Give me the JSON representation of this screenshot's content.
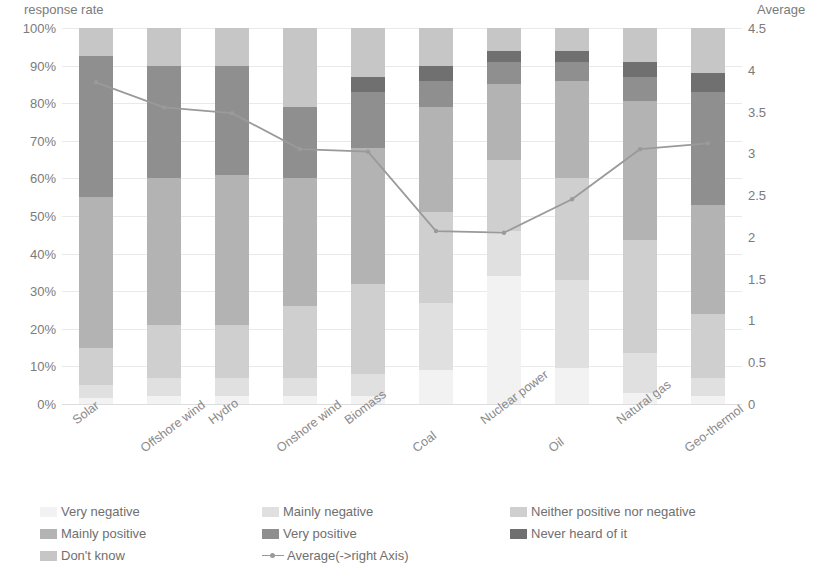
{
  "chart_data": {
    "type": "bar",
    "stacked": true,
    "stack_mode": "100%",
    "title": "",
    "xlabel": "",
    "ylabel": "response rate",
    "y2label": "Average",
    "ylim": [
      0,
      100
    ],
    "y2lim": [
      0,
      4.5
    ],
    "grid": true,
    "legend_position": "bottom",
    "categories": [
      "Solar",
      "Offshore wind",
      "Hydro",
      "Onshore wind",
      "Biomass",
      "Coal",
      "Nuclear power",
      "Oil",
      "Natural gas",
      "Geo-thermol"
    ],
    "ytick_labels": [
      "0%",
      "10%",
      "20%",
      "30%",
      "40%",
      "50%",
      "60%",
      "70%",
      "80%",
      "90%",
      "100%"
    ],
    "ytick_values": [
      0,
      10,
      20,
      30,
      40,
      50,
      60,
      70,
      80,
      90,
      100
    ],
    "y2tick_labels": [
      "0",
      "0.5",
      "1",
      "1.5",
      "2",
      "2.5",
      "3",
      "3.5",
      "4",
      "4.5"
    ],
    "y2tick_values": [
      0,
      0.5,
      1,
      1.5,
      2,
      2.5,
      3,
      3.5,
      4,
      4.5
    ],
    "series": [
      {
        "name": "Very negative",
        "color": "#f2f2f2",
        "values": [
          1.5,
          2.0,
          2.0,
          2.0,
          2.0,
          9.0,
          34.0,
          9.5,
          3.0,
          2.0
        ]
      },
      {
        "name": "Mainly  negative",
        "color": "#e0e0e0",
        "values": [
          3.5,
          5.0,
          5.0,
          5.0,
          6.0,
          18.0,
          12.0,
          23.5,
          10.5,
          5.0
        ]
      },
      {
        "name": "Neither positive nor negative",
        "color": "#cfcfcf",
        "values": [
          10.0,
          14.0,
          14.0,
          19.0,
          24.0,
          24.0,
          19.0,
          27.0,
          30.0,
          17.0
        ]
      },
      {
        "name": "Mainly positive",
        "color": "#b3b3b3",
        "values": [
          40.0,
          39.0,
          40.0,
          34.0,
          36.0,
          28.0,
          20.0,
          26.0,
          37.0,
          29.0
        ]
      },
      {
        "name": "Very positive",
        "color": "#8f8f8f",
        "values": [
          37.5,
          30.0,
          29.0,
          19.0,
          15.0,
          7.0,
          6.0,
          5.0,
          6.5,
          30.0
        ]
      },
      {
        "name": "Never heard of it",
        "color": "#707070",
        "values": [
          0.0,
          0.0,
          0.0,
          0.0,
          4.0,
          4.0,
          3.0,
          3.0,
          4.0,
          5.0
        ]
      },
      {
        "name": "Don't know",
        "color": "#c6c6c6",
        "values": [
          7.5,
          10.0,
          10.0,
          21.0,
          13.0,
          10.0,
          6.0,
          6.0,
          9.0,
          12.0
        ]
      }
    ],
    "line_series": {
      "name": "Average(->right Axis)",
      "color": "#9a9a9a",
      "axis": "right",
      "values": [
        3.85,
        3.55,
        3.48,
        3.05,
        3.02,
        2.07,
        2.05,
        2.45,
        3.05,
        3.12
      ]
    }
  },
  "legend": {
    "items": [
      {
        "label": "Very negative",
        "kind": "swatch",
        "color": "#f2f2f2"
      },
      {
        "label": "Mainly  negative",
        "kind": "swatch",
        "color": "#e0e0e0"
      },
      {
        "label": "Neither positive nor negative",
        "kind": "swatch",
        "color": "#cfcfcf"
      },
      {
        "label": "Mainly positive",
        "kind": "swatch",
        "color": "#b3b3b3"
      },
      {
        "label": "Very positive",
        "kind": "swatch",
        "color": "#8f8f8f"
      },
      {
        "label": "Never heard of it",
        "kind": "swatch",
        "color": "#707070"
      },
      {
        "label": "Don't know",
        "kind": "swatch",
        "color": "#c6c6c6"
      },
      {
        "label": "Average(->right Axis)",
        "kind": "line",
        "color": "#9a9a9a"
      }
    ]
  }
}
